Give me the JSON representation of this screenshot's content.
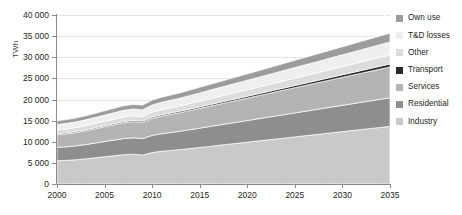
{
  "chart_data": {
    "type": "area",
    "stacked": true,
    "title": "",
    "subtitle": "",
    "xlabel": "",
    "ylabel": "TWh",
    "x": [
      2000,
      2001,
      2002,
      2003,
      2004,
      2005,
      2006,
      2007,
      2008,
      2009,
      2010,
      2011,
      2012,
      2013,
      2014,
      2015,
      2016,
      2017,
      2018,
      2019,
      2020,
      2021,
      2022,
      2023,
      2024,
      2025,
      2026,
      2027,
      2028,
      2029,
      2030,
      2031,
      2032,
      2033,
      2034,
      2035
    ],
    "xlim": [
      2000,
      2035
    ],
    "ylim": [
      0,
      40000
    ],
    "xticks": [
      "2000",
      "2005",
      "2010",
      "2015",
      "2020",
      "2025",
      "2030",
      "2035"
    ],
    "yticks": [
      "0",
      "5 000",
      "10 000",
      "15 000",
      "20 000",
      "25 000",
      "30 000",
      "35 000",
      "40 000"
    ],
    "ytick_values": [
      0,
      5000,
      10000,
      15000,
      20000,
      25000,
      30000,
      35000,
      40000
    ],
    "grid": "horizontal-dotted",
    "legend_position": "right",
    "series": [
      {
        "name": "Industry",
        "color": "#c9c9c9",
        "values": [
          5500,
          5600,
          5750,
          5950,
          6200,
          6450,
          6700,
          6950,
          7050,
          6850,
          7450,
          7750,
          7950,
          8150,
          8400,
          8650,
          8900,
          9150,
          9400,
          9650,
          9900,
          10150,
          10400,
          10650,
          10900,
          11150,
          11400,
          11650,
          11900,
          12150,
          12400,
          12650,
          12900,
          13150,
          13400,
          13650
        ]
      },
      {
        "name": "Residential",
        "color": "#8e8e8e",
        "values": [
          3150,
          3200,
          3280,
          3380,
          3480,
          3600,
          3700,
          3800,
          3880,
          3900,
          4050,
          4150,
          4250,
          4350,
          4460,
          4570,
          4680,
          4790,
          4900,
          5010,
          5120,
          5230,
          5340,
          5450,
          5560,
          5670,
          5780,
          5890,
          6000,
          6110,
          6220,
          6330,
          6440,
          6550,
          6660,
          6770
        ]
      },
      {
        "name": "Services",
        "color": "#b4b4b4",
        "values": [
          3000,
          3080,
          3160,
          3260,
          3380,
          3500,
          3620,
          3740,
          3820,
          3830,
          4050,
          4180,
          4300,
          4420,
          4550,
          4680,
          4810,
          4940,
          5070,
          5200,
          5330,
          5460,
          5590,
          5720,
          5850,
          5980,
          6110,
          6240,
          6370,
          6500,
          6630,
          6760,
          6890,
          7020,
          7150,
          7280
        ]
      },
      {
        "name": "Transport",
        "color": "#2b2b2b",
        "values": [
          230,
          235,
          240,
          245,
          252,
          260,
          268,
          276,
          282,
          285,
          300,
          310,
          320,
          330,
          342,
          354,
          366,
          378,
          392,
          406,
          420,
          436,
          452,
          468,
          486,
          504,
          522,
          540,
          560,
          580,
          600,
          620,
          642,
          664,
          686,
          710
        ]
      },
      {
        "name": "Other",
        "color": "#dcdcdc",
        "values": [
          900,
          915,
          935,
          960,
          990,
          1020,
          1050,
          1080,
          1100,
          1100,
          1160,
          1195,
          1230,
          1265,
          1300,
          1340,
          1380,
          1420,
          1460,
          1500,
          1540,
          1580,
          1620,
          1660,
          1700,
          1740,
          1780,
          1820,
          1860,
          1900,
          1940,
          1980,
          2020,
          2060,
          2100,
          2140
        ]
      },
      {
        "name": "T&D losses",
        "color": "#efefef",
        "values": [
          1300,
          1320,
          1350,
          1390,
          1440,
          1490,
          1540,
          1590,
          1620,
          1610,
          1710,
          1760,
          1810,
          1860,
          1915,
          1970,
          2025,
          2080,
          2135,
          2190,
          2245,
          2300,
          2355,
          2410,
          2465,
          2520,
          2575,
          2630,
          2685,
          2740,
          2795,
          2850,
          2905,
          2960,
          3015,
          3070
        ]
      },
      {
        "name": "Own use",
        "color": "#9c9c9c",
        "values": [
          880,
          895,
          915,
          940,
          970,
          1000,
          1030,
          1060,
          1080,
          1075,
          1140,
          1175,
          1210,
          1245,
          1282,
          1320,
          1358,
          1396,
          1434,
          1472,
          1510,
          1548,
          1586,
          1624,
          1662,
          1700,
          1738,
          1776,
          1814,
          1852,
          1890,
          1928,
          1966,
          2004,
          2042,
          2080
        ]
      }
    ],
    "legend_order_top_to_bottom": [
      "Own use",
      "T&D losses",
      "Other",
      "Transport",
      "Services",
      "Residential",
      "Industry"
    ],
    "totals": {
      "2000": 14960,
      "2009": 16650,
      "2010": 19860,
      "2020": 26065,
      "2035": 35700
    }
  },
  "axes": {
    "y_title": "TWh"
  }
}
